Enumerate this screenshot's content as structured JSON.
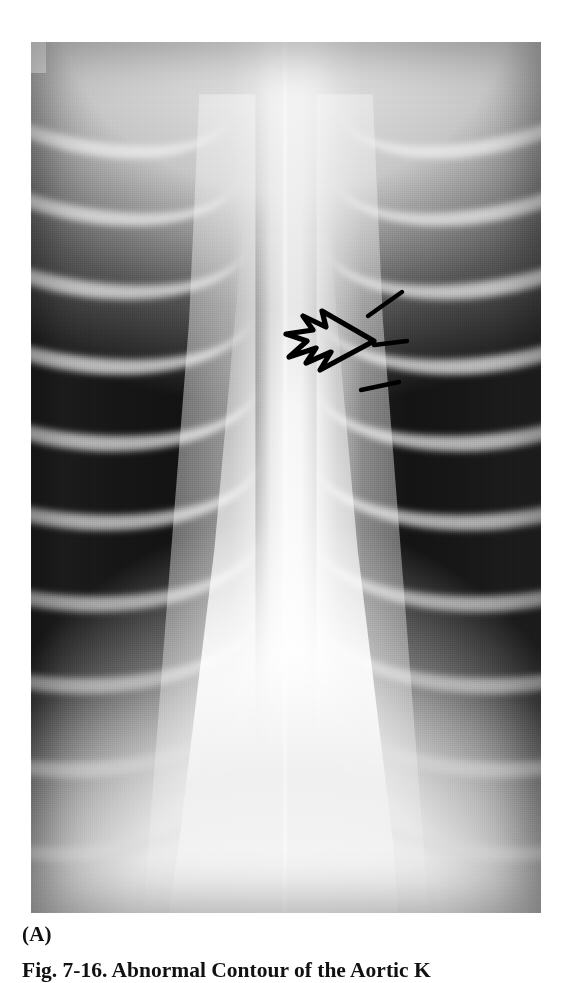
{
  "figure": {
    "panel_label": "(A)",
    "caption": "Fig. 7-16.   Abnormal Contour of the Aortic K",
    "caption_truncated": true,
    "modality": "chest radiograph",
    "view": "PA (frontal)",
    "background_color": "#ffffff",
    "film_dark": "#141414",
    "film_bright": "#f4f4f4",
    "annotation_color": "#000000"
  },
  "image_region": {
    "left": 31,
    "top": 42,
    "width": 510,
    "height": 871
  },
  "annotations": {
    "open_arrow": {
      "name": "open-arrow-marker",
      "description": "hollow open arrow pointing right at the aortic knob",
      "tip_x": 372,
      "tip_y": 341
    },
    "tick_markers": [
      {
        "name": "tick-marker-upper",
        "x1": 368,
        "y1": 316,
        "x2": 402,
        "y2": 292
      },
      {
        "name": "tick-marker-middle",
        "x1": 374,
        "y1": 345,
        "x2": 407,
        "y2": 341
      },
      {
        "name": "tick-marker-lower",
        "x1": 361,
        "y1": 390,
        "x2": 399,
        "y2": 382
      }
    ]
  },
  "anatomy_labels": {
    "left_lung": "left lung field",
    "right_lung": "right lung field",
    "mediastinum": "mediastinum",
    "aortic_knob": "aortic knob",
    "ribs": "posterior rib arcs",
    "spine": "thoracic spine"
  }
}
